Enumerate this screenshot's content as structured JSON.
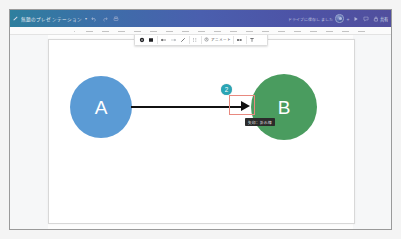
{
  "app": {
    "header": {
      "doc_title": "無題のプレゼンテーション",
      "title_chevron": "▾",
      "undo_icon": "undo-icon",
      "redo_icon": "redo-icon",
      "print_icon": "print-icon",
      "save_status": "ドライブに保存しました",
      "avatar_label": "account-avatar",
      "plus_label": "+",
      "present_icon": "present-icon",
      "comment_icon": "comment-icon",
      "share_icon": "lock-icon",
      "share_label": "共有"
    },
    "ruler": {
      "name": "horizontal-ruler",
      "tick_count": 19
    },
    "shape_toolbar": {
      "items": [
        {
          "name": "filled-circle-tool",
          "icon": "circle-filled-icon",
          "label": ""
        },
        {
          "name": "fill-color-tool",
          "icon": "square-filled-icon",
          "label": ""
        },
        {
          "name": "line-start-arrow-tool",
          "icon": "arrow-left-icon",
          "label": ""
        },
        {
          "name": "line-end-arrow-tool",
          "icon": "arrow-right-icon",
          "label": ""
        },
        {
          "name": "line-style-tool",
          "icon": "diagonal-line-icon",
          "label": ""
        },
        {
          "name": "line-dash-tool",
          "icon": "dashed-line-icon",
          "label": ""
        },
        {
          "name": "animate-tool",
          "icon": "animate-icon",
          "label": "アニメート"
        },
        {
          "name": "more-options-tool",
          "icon": "more-horizontal-icon",
          "label": ""
        },
        {
          "name": "text-tool",
          "icon": "text-t-icon",
          "label": "T"
        }
      ]
    },
    "slide": {
      "name": "slide-canvas",
      "nodes": [
        {
          "id": "node-a",
          "label": "A",
          "color": "#5b9bd5"
        },
        {
          "id": "node-b",
          "label": "B",
          "color": "#4a9c5f"
        }
      ],
      "connector": {
        "name": "arrow-connector",
        "color": "#111111"
      },
      "selection": {
        "name": "selection-rectangle",
        "color": "#e8897f"
      },
      "badge": {
        "name": "step-badge",
        "value": "2",
        "color": "#2aa5b5"
      },
      "tooltip": {
        "name": "element-tooltip",
        "text": "矢印：折れ線"
      }
    }
  }
}
